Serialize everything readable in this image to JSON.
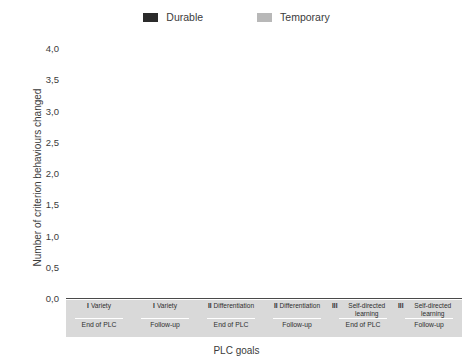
{
  "chart_data": {
    "type": "bar",
    "subtype": "stacked-bar",
    "title": "",
    "xlabel": "PLC goals",
    "ylabel": "Number of criterion behaviours changed",
    "ylim": [
      0,
      4.0
    ],
    "ytick_labels": [
      "4,0",
      "3,5",
      "3,0",
      "2,5",
      "2,0",
      "1,5",
      "1,0",
      "0,5",
      "0,0"
    ],
    "ytick_values": [
      4.0,
      3.5,
      3.0,
      2.5,
      2.0,
      1.5,
      1.0,
      0.5,
      0.0
    ],
    "grid": false,
    "legend_position": "top-center",
    "categories": [
      "I Variety / End of PLC",
      "I Variety / Follow-up",
      "II Differentiation / End of PLC",
      "II Differentiation / Follow-up",
      "III Self-directed learning / End of PLC",
      "III Self-directed learning / Follow-up"
    ],
    "series": [
      {
        "name": "Durable",
        "color": "#2b2b2b",
        "values": [
          3.5,
          2.35,
          1.82,
          0.42,
          0.78,
          0.57
        ]
      },
      {
        "name": "Temporary",
        "color": "#b8b8b8",
        "values": [
          0.0,
          0.9,
          0.0,
          0.73,
          0.0,
          0.15
        ]
      }
    ],
    "totals": [
      3.5,
      3.25,
      1.82,
      1.15,
      0.78,
      0.72
    ]
  },
  "legend": {
    "items": [
      {
        "label": "Durable",
        "color": "#2b2b2b"
      },
      {
        "label": "Temporary",
        "color": "#b8b8b8"
      }
    ]
  },
  "axes": {
    "y_title": "Number of criterion behaviours changed",
    "x_title": "PLC goals",
    "y_ticks": [
      "4,0",
      "3,5",
      "3,0",
      "2,5",
      "2,0",
      "1,5",
      "1,0",
      "0,5",
      "0,0"
    ]
  },
  "categories": [
    {
      "numeral": "I",
      "goal": "Variety",
      "phase": "End of PLC"
    },
    {
      "numeral": "I",
      "goal": "Variety",
      "phase": "Follow-up"
    },
    {
      "numeral": "II",
      "goal": "Differentiation",
      "phase": "End of PLC"
    },
    {
      "numeral": "II",
      "goal": "Differentiation",
      "phase": "Follow-up"
    },
    {
      "numeral": "III",
      "goal": "Self-directed learning",
      "phase": "End of PLC"
    },
    {
      "numeral": "III",
      "goal": "Self-directed learning",
      "phase": "Follow-up"
    }
  ]
}
